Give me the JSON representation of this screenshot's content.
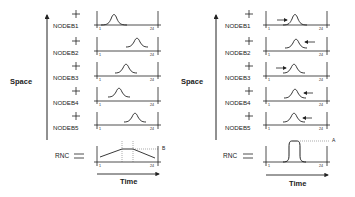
{
  "diagrams": [
    {
      "id": "left",
      "y_axis_label": "Space",
      "x_axis_label": "Time",
      "tick_start": "1",
      "tick_end": "24",
      "nodes": [
        {
          "label": "NODEB1",
          "peak_pos": 0.35,
          "arrow": "none"
        },
        {
          "label": "NODEB2",
          "peak_pos": 0.78,
          "arrow": "none"
        },
        {
          "label": "NODEB3",
          "peak_pos": 0.57,
          "arrow": "none"
        },
        {
          "label": "NODEB4",
          "peak_pos": 0.45,
          "arrow": "none"
        },
        {
          "label": "NODEB5",
          "peak_pos": 0.7,
          "arrow": "none"
        }
      ],
      "rnc": {
        "label": "RNC",
        "shape": "broad-plateau",
        "annotation": "B"
      }
    },
    {
      "id": "right",
      "y_axis_label": "Space",
      "x_axis_label": "Time",
      "tick_start": "1",
      "tick_end": "24",
      "nodes": [
        {
          "label": "NODEB1",
          "peak_pos": 0.55,
          "arrow": "right"
        },
        {
          "label": "NODEB2",
          "peak_pos": 0.55,
          "arrow": "left"
        },
        {
          "label": "NODEB3",
          "peak_pos": 0.5,
          "arrow": "right"
        },
        {
          "label": "NODEB4",
          "peak_pos": 0.52,
          "arrow": "left"
        },
        {
          "label": "NODEB5",
          "peak_pos": 0.5,
          "arrow": "left"
        }
      ],
      "rnc": {
        "label": "RNC",
        "shape": "narrow-spike",
        "annotation": "A"
      }
    }
  ],
  "colors": {
    "line": "#222222",
    "dotted": "#555555",
    "background": "#ffffff"
  }
}
